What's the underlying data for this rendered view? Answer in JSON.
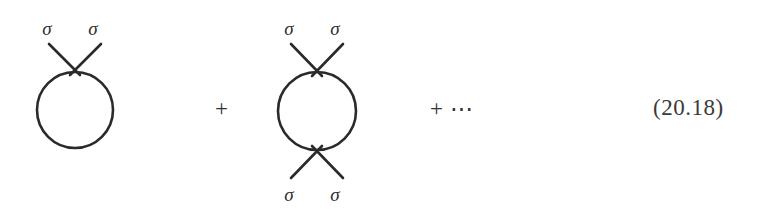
{
  "figure": {
    "kind": "feynman-diagram-series",
    "equation_number": "(20.18)",
    "stroke_color": "#2b2a2a",
    "text_color": "#302f2f",
    "background_color": "#ffffff"
  },
  "terms": [
    {
      "id": "one-loop-tadpole",
      "loop_shape": "circle",
      "external_legs_top": 2,
      "external_legs_bottom": 0,
      "labels_top": [
        "σ",
        "σ"
      ],
      "labels_bottom": []
    },
    {
      "id": "two-point-bubble",
      "loop_shape": "circle",
      "external_legs_top": 2,
      "external_legs_bottom": 2,
      "labels_top": [
        "σ",
        "σ"
      ],
      "labels_bottom": [
        "σ",
        "σ"
      ]
    }
  ],
  "operators": {
    "plus_first": "+",
    "plus_ellipsis": "+ ⋯"
  }
}
